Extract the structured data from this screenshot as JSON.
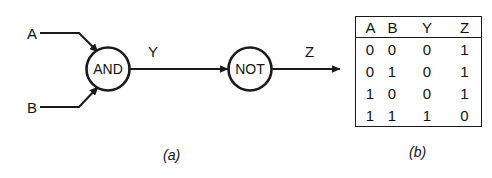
{
  "figure": {
    "diagram": {
      "caption": "(a)",
      "inputs": [
        {
          "label": "A",
          "name": "input-a"
        },
        {
          "label": "B",
          "name": "input-b"
        }
      ],
      "gates": [
        {
          "label": "AND",
          "name": "and-gate"
        },
        {
          "label": "NOT",
          "name": "not-gate"
        }
      ],
      "signals": [
        {
          "label": "Y",
          "name": "signal-y"
        },
        {
          "label": "Z",
          "name": "signal-z"
        }
      ]
    },
    "table": {
      "caption": "(b)",
      "headers": [
        "A",
        "B",
        "Y",
        "Z"
      ],
      "rows": [
        {
          "a": "0",
          "b": "0",
          "y": "0",
          "z": "1"
        },
        {
          "a": "0",
          "b": "1",
          "y": "0",
          "z": "1"
        },
        {
          "a": "1",
          "b": "0",
          "y": "0",
          "z": "1"
        },
        {
          "a": "1",
          "b": "1",
          "y": "1",
          "z": "0"
        }
      ]
    },
    "colors": {
      "ink": "#111111",
      "line": "#1a1a1a",
      "background": "#ffffff"
    }
  }
}
